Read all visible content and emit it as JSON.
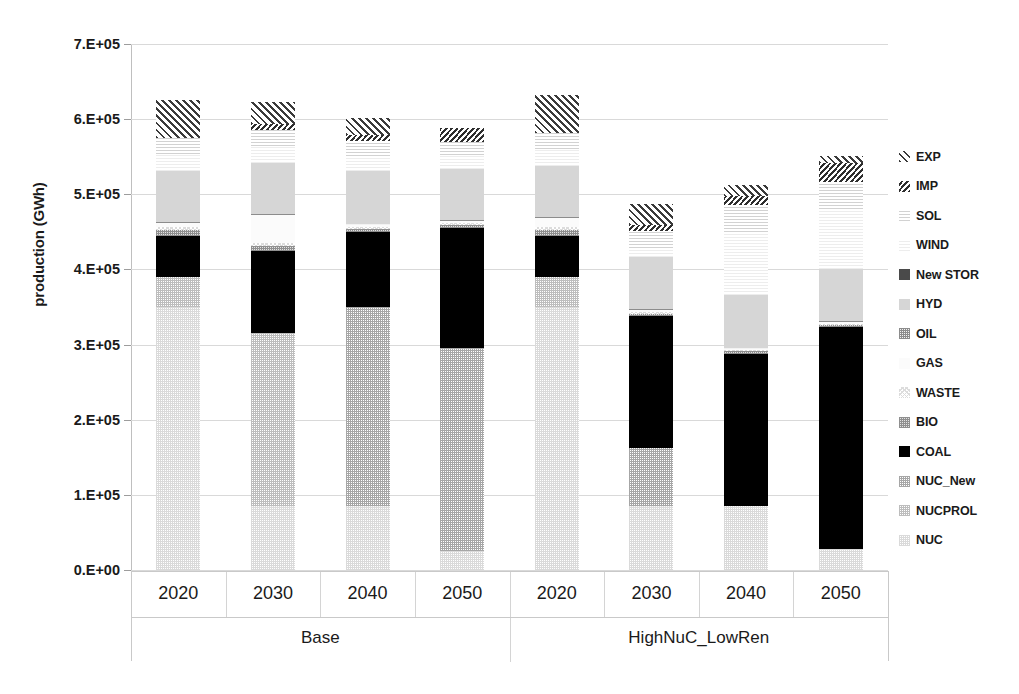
{
  "chart_data": {
    "type": "bar",
    "subtype": "stacked-bar",
    "title": "",
    "xlabel": "",
    "ylabel": "production (GWh)",
    "ylim": [
      0,
      700000
    ],
    "ytick_labels": [
      "0.E+00",
      "1.E+05",
      "2.E+05",
      "3.E+05",
      "4.E+05",
      "5.E+05",
      "6.E+05",
      "7.E+05"
    ],
    "ytick_values": [
      0,
      100000,
      200000,
      300000,
      400000,
      500000,
      600000,
      700000
    ],
    "grid": true,
    "legend_position": "right",
    "groups": [
      "Base",
      "HighNuC_LowRen"
    ],
    "categories": [
      "2020",
      "2030",
      "2040",
      "2050",
      "2020",
      "2030",
      "2040",
      "2050"
    ],
    "group_spans": [
      {
        "label": "Base",
        "categories": [
          "2020",
          "2030",
          "2040",
          "2050"
        ]
      },
      {
        "label": "HighNuC_LowRen",
        "categories": [
          "2020",
          "2030",
          "2040",
          "2050"
        ]
      }
    ],
    "series": [
      {
        "name": "NUC",
        "key": "nuc",
        "pattern": "fine-dot-very-light",
        "values": [
          350000,
          85000,
          85000,
          25000,
          350000,
          85000,
          85000,
          28000
        ]
      },
      {
        "name": "NUCPROL",
        "key": "nucprol",
        "pattern": "fine-dot-light",
        "values": [
          40000,
          230000,
          0,
          0,
          40000,
          0,
          0,
          0
        ]
      },
      {
        "name": "NUC_New",
        "key": "nucnew",
        "pattern": "fine-dot-medium",
        "values": [
          0,
          0,
          265000,
          270000,
          0,
          78000,
          0,
          0
        ]
      },
      {
        "name": "COAL",
        "key": "coal",
        "pattern": "solid-black",
        "values": [
          55000,
          110000,
          100000,
          160000,
          55000,
          175000,
          203000,
          295000
        ]
      },
      {
        "name": "BIO",
        "key": "bio",
        "pattern": "dot-grid-dark",
        "values": [
          8000,
          6000,
          4000,
          4000,
          8000,
          3000,
          3000,
          3000
        ]
      },
      {
        "name": "WASTE",
        "key": "waste",
        "pattern": "cross-hatch-light",
        "values": [
          4000,
          4000,
          3000,
          3000,
          4000,
          3000,
          2000,
          2000
        ]
      },
      {
        "name": "GAS",
        "key": "gas",
        "pattern": "near-white",
        "values": [
          5000,
          38000,
          3000,
          3000,
          12000,
          2000,
          2000,
          2000
        ]
      },
      {
        "name": "OIL",
        "key": "oil",
        "pattern": "dot-grid-medium",
        "values": [
          1000,
          1000,
          1000,
          1000,
          1000,
          1000,
          1000,
          1000
        ]
      },
      {
        "name": "HYD",
        "key": "hyd",
        "pattern": "solid-light-gray",
        "values": [
          68000,
          68000,
          70000,
          68000,
          68000,
          70000,
          70000,
          70000
        ]
      },
      {
        "name": "New STOR",
        "key": "newstor",
        "pattern": "solid-dark-gray",
        "values": [
          0,
          0,
          0,
          0,
          0,
          0,
          0,
          0
        ]
      },
      {
        "name": "WIND",
        "key": "wind",
        "pattern": "h-lines-very-light",
        "values": [
          22000,
          22000,
          20000,
          18000,
          22000,
          12000,
          84000,
          80000
        ]
      },
      {
        "name": "SOL",
        "key": "sol",
        "pattern": "h-lines-light",
        "values": [
          22000,
          22000,
          20000,
          18000,
          22000,
          22000,
          36000,
          36000
        ]
      },
      {
        "name": "IMP",
        "key": "imp",
        "pattern": "hatch-narrow",
        "values": [
          0,
          8000,
          8000,
          18000,
          0,
          8000,
          12000,
          24000
        ]
      },
      {
        "name": "EXP",
        "key": "exp",
        "pattern": "hatch-diagonal",
        "values": [
          50000,
          29000,
          22000,
          0,
          50000,
          28000,
          14000,
          10000
        ]
      }
    ],
    "legend_order_top_to_bottom": [
      "EXP",
      "IMP",
      "SOL",
      "WIND",
      "New STOR",
      "HYD",
      "OIL",
      "GAS",
      "WASTE",
      "BIO",
      "COAL",
      "NUC_New",
      "NUCPROL",
      "NUC"
    ],
    "bar_totals": [
      625000,
      623000,
      601000,
      588000,
      632000,
      487000,
      512000,
      551000
    ]
  },
  "legend": {
    "items": [
      {
        "label": "EXP",
        "swatch": "exp"
      },
      {
        "label": "IMP",
        "swatch": "imp"
      },
      {
        "label": "SOL",
        "swatch": "sol"
      },
      {
        "label": "WIND",
        "swatch": "wind"
      },
      {
        "label": "New STOR",
        "swatch": "newstor"
      },
      {
        "label": "HYD",
        "swatch": "hyd"
      },
      {
        "label": "OIL",
        "swatch": "oil"
      },
      {
        "label": "GAS",
        "swatch": "gas"
      },
      {
        "label": "WASTE",
        "swatch": "waste"
      },
      {
        "label": "BIO",
        "swatch": "bio"
      },
      {
        "label": "COAL",
        "swatch": "coal"
      },
      {
        "label": "NUC_New",
        "swatch": "nucnew"
      },
      {
        "label": "NUCPROL",
        "swatch": "nucprol"
      },
      {
        "label": "NUC",
        "swatch": "nuc"
      }
    ]
  },
  "colors": {
    "coal": "#000000",
    "hyd": "#d6d6d6",
    "newstor": "#4a4a4a",
    "gridline": "#d9d9d9",
    "text": "#1a1a1a",
    "background": "#ffffff"
  }
}
